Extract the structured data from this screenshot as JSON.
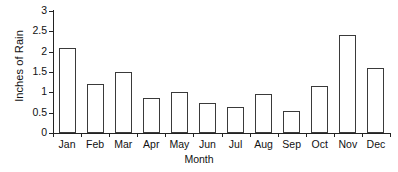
{
  "chart_data": {
    "type": "bar",
    "title": "",
    "xlabel": "Month",
    "ylabel": "Inches of Rain",
    "categories": [
      "Jan",
      "Feb",
      "Mar",
      "Apr",
      "May",
      "Jun",
      "Jul",
      "Aug",
      "Sep",
      "Oct",
      "Nov",
      "Dec"
    ],
    "values": [
      2.1,
      1.2,
      1.5,
      0.85,
      1.0,
      0.75,
      0.65,
      0.95,
      0.55,
      1.15,
      2.4,
      1.6
    ],
    "ylim": [
      0,
      3
    ],
    "ytick_labels": [
      "0",
      "0.5",
      "1",
      "1.5",
      "2",
      "2.5",
      "3"
    ],
    "ytick_values": [
      0,
      0.5,
      1,
      1.5,
      2,
      2.5,
      3
    ],
    "grid": false,
    "legend": null,
    "bar_fill_color": "#ffffff",
    "bar_edge_color": "#3a3a3a",
    "axis_color": "#222222",
    "background_color": "#ffffff"
  }
}
